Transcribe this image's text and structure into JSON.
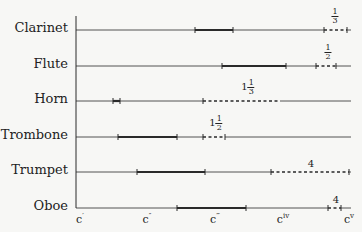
{
  "chart_data": {
    "type": "range",
    "title": "",
    "xlabel": "",
    "ylabel": "",
    "x_ticks": [
      {
        "label": "c",
        "sup": "′",
        "x": 80
      },
      {
        "label": "c",
        "sup": "″",
        "x": 147
      },
      {
        "label": "c",
        "sup": "‴",
        "x": 215
      },
      {
        "label": "c",
        "sup": "iv",
        "x": 283
      },
      {
        "label": "c",
        "sup": "v",
        "x": 349
      }
    ],
    "axis": {
      "x0": 76,
      "x1": 351,
      "y_top": 16,
      "y_bottom": 208
    },
    "instruments": [
      {
        "name": "Clarinet",
        "y": 30,
        "thick": [
          [
            195,
            233
          ]
        ],
        "dashed": [
          [
            324,
            347
          ]
        ],
        "ticks": [
          195,
          233,
          324,
          347
        ],
        "annotation": {
          "whole": "",
          "num": "1",
          "den": "3",
          "x": 335
        }
      },
      {
        "name": "Flute",
        "y": 66,
        "thick": [
          [
            222,
            286
          ]
        ],
        "dashed": [
          [
            316,
            336
          ]
        ],
        "ticks": [
          222,
          286,
          316,
          336
        ],
        "annotation": {
          "whole": "",
          "num": "1",
          "den": "2",
          "x": 328
        }
      },
      {
        "name": "Horn",
        "y": 101,
        "thick": [
          [
            113,
            120
          ]
        ],
        "dashed": [
          [
            203,
            280
          ]
        ],
        "ticks": [
          113,
          120,
          203
        ],
        "annotation": {
          "whole": "1",
          "num": "1",
          "den": "3",
          "x": 248
        }
      },
      {
        "name": "Trombone",
        "y": 137,
        "thick": [
          [
            118,
            177
          ]
        ],
        "dashed": [
          [
            203,
            225
          ]
        ],
        "ticks": [
          118,
          177,
          203,
          225
        ],
        "annotation": {
          "whole": "1",
          "num": "1",
          "den": "2",
          "x": 216
        }
      },
      {
        "name": "Trumpet",
        "y": 172,
        "thick": [
          [
            137,
            205
          ]
        ],
        "dashed": [
          [
            271,
            349
          ]
        ],
        "ticks": [
          137,
          205,
          271,
          349
        ],
        "annotation": {
          "whole": "4",
          "num": "",
          "den": "",
          "x": 311
        }
      },
      {
        "name": "Oboe",
        "y": 208,
        "thick": [
          [
            177,
            246
          ]
        ],
        "dashed": [
          [
            328,
            341
          ]
        ],
        "ticks": [
          177,
          246,
          328,
          341
        ],
        "annotation": {
          "whole": "4",
          "num": "",
          "den": "",
          "x": 336
        }
      }
    ]
  }
}
